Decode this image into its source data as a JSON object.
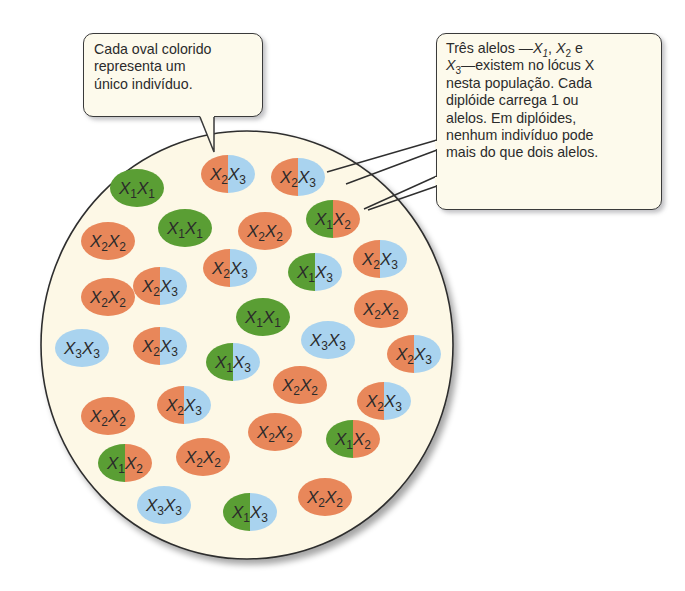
{
  "callouts": {
    "left": {
      "lines": [
        "Cada oval colorido",
        "representa um",
        "único indivíduo."
      ]
    },
    "right": {
      "line1_prefix": "Três alelos —",
      "line1_a1": "X",
      "line1_a1_sub": "1",
      "line1_sep1": ", ",
      "line1_a2": "X",
      "line1_a2_sub": "2",
      "line1_suffix": " e",
      "line2_a3": "X",
      "line2_a3_sub": "3",
      "line2_suffix": "—existem no lócus X",
      "lines_rest": [
        "nesta população. Cada",
        "diplóide carrega 1 ou",
        "alelos. Em diplóides,",
        "nenhum indivíduo pode",
        "mais do que dois alelos."
      ]
    }
  },
  "colors": {
    "X1": "#5a9e34",
    "X2": "#e8875a",
    "X3": "#a9d3ef",
    "population_fill": "#fdf8e6",
    "outline": "#2f2f2f",
    "text": "#2b2b2b"
  },
  "population": {
    "label": "population-circle",
    "individuals": [
      {
        "a": "1",
        "b": "1",
        "x": 137,
        "y": 188
      },
      {
        "a": "2",
        "b": "3",
        "x": 228,
        "y": 174
      },
      {
        "a": "2",
        "b": "3",
        "x": 298,
        "y": 177
      },
      {
        "a": "1",
        "b": "1",
        "x": 185,
        "y": 228
      },
      {
        "a": "2",
        "b": "2",
        "x": 108,
        "y": 241
      },
      {
        "a": "2",
        "b": "2",
        "x": 265,
        "y": 231
      },
      {
        "a": "1",
        "b": "2",
        "x": 333,
        "y": 219
      },
      {
        "a": "2",
        "b": "3",
        "x": 230,
        "y": 268
      },
      {
        "a": "1",
        "b": "3",
        "x": 315,
        "y": 272
      },
      {
        "a": "2",
        "b": "3",
        "x": 380,
        "y": 259
      },
      {
        "a": "2",
        "b": "3",
        "x": 160,
        "y": 286
      },
      {
        "a": "2",
        "b": "2",
        "x": 108,
        "y": 297
      },
      {
        "a": "1",
        "b": "1",
        "x": 263,
        "y": 317
      },
      {
        "a": "2",
        "b": "2",
        "x": 381,
        "y": 309
      },
      {
        "a": "3",
        "b": "3",
        "x": 82,
        "y": 348
      },
      {
        "a": "2",
        "b": "3",
        "x": 160,
        "y": 346
      },
      {
        "a": "1",
        "b": "3",
        "x": 233,
        "y": 362
      },
      {
        "a": "3",
        "b": "3",
        "x": 328,
        "y": 340
      },
      {
        "a": "2",
        "b": "3",
        "x": 414,
        "y": 354
      },
      {
        "a": "2",
        "b": "2",
        "x": 300,
        "y": 385
      },
      {
        "a": "2",
        "b": "2",
        "x": 108,
        "y": 416
      },
      {
        "a": "2",
        "b": "3",
        "x": 184,
        "y": 405
      },
      {
        "a": "2",
        "b": "3",
        "x": 384,
        "y": 401
      },
      {
        "a": "2",
        "b": "2",
        "x": 275,
        "y": 432
      },
      {
        "a": "1",
        "b": "2",
        "x": 353,
        "y": 439
      },
      {
        "a": "2",
        "b": "2",
        "x": 203,
        "y": 457
      },
      {
        "a": "1",
        "b": "2",
        "x": 125,
        "y": 463
      },
      {
        "a": "3",
        "b": "3",
        "x": 164,
        "y": 505
      },
      {
        "a": "1",
        "b": "3",
        "x": 250,
        "y": 512
      },
      {
        "a": "2",
        "b": "2",
        "x": 325,
        "y": 497
      }
    ]
  }
}
